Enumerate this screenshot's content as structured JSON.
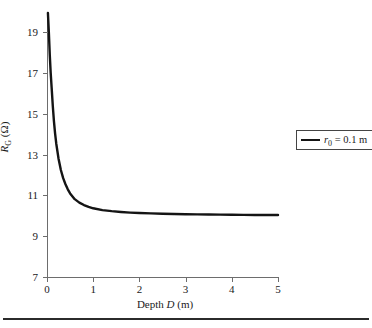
{
  "chart_data": {
    "type": "line",
    "title": "",
    "xlabel": "Depth D (m)",
    "ylabel": "R_G (Ω)",
    "xlabel_parts": {
      "pre": "Depth ",
      "var": "D",
      "post": " (m)"
    },
    "ylabel_parts": {
      "var": "R",
      "sub": "G",
      "post": " (Ω)"
    },
    "xlim": [
      0,
      5
    ],
    "ylim": [
      7,
      20
    ],
    "xticks": [
      0,
      1,
      2,
      3,
      4,
      5
    ],
    "yticks": [
      7,
      9,
      11,
      13,
      15,
      17,
      19
    ],
    "xtick_labels": [
      "0",
      "1",
      "2",
      "3",
      "4",
      "5"
    ],
    "ytick_labels": [
      "7",
      "9",
      "11",
      "13",
      "15",
      "17",
      "19"
    ],
    "grid": false,
    "legend_position": "right",
    "series": [
      {
        "name": "r_0 = 0.1 m",
        "color": "#141414",
        "x": [
          0.02,
          0.04,
          0.06,
          0.08,
          0.1,
          0.125,
          0.15,
          0.175,
          0.2,
          0.25,
          0.3,
          0.35,
          0.4,
          0.45,
          0.5,
          0.6,
          0.7,
          0.8,
          0.9,
          1.0,
          1.2,
          1.4,
          1.6,
          1.8,
          2.0,
          2.25,
          2.5,
          2.75,
          3.0,
          3.25,
          3.5,
          3.75,
          4.0,
          4.25,
          4.5,
          4.75,
          5.0
        ],
        "y": [
          19.95,
          19.0,
          17.9,
          17.0,
          16.3,
          15.4,
          14.65,
          14.05,
          13.55,
          12.8,
          12.25,
          11.85,
          11.55,
          11.3,
          11.1,
          10.82,
          10.65,
          10.53,
          10.44,
          10.37,
          10.28,
          10.23,
          10.19,
          10.16,
          10.14,
          10.12,
          10.1,
          10.09,
          10.08,
          10.07,
          10.065,
          10.06,
          10.055,
          10.05,
          10.045,
          10.04,
          10.04
        ]
      }
    ],
    "legend": [
      {
        "text": "r0 = 0.1 m",
        "parts": {
          "var": "r",
          "sub": "0",
          "post": " = 0.1 m"
        },
        "color": "#141414"
      }
    ]
  },
  "figure": {
    "axis_color": "#6d6d6d",
    "text_color": "#1a1a1a",
    "background": "#ffffff",
    "rule_color": "#2b2b2b"
  }
}
